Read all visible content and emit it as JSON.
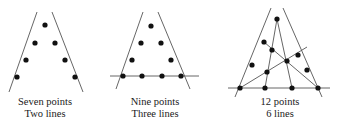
{
  "figures": [
    {
      "caption_line1": "Seven points",
      "caption_line2": "Two lines",
      "lines": [
        [
          37,
          12,
          9,
          92
        ],
        [
          52,
          12,
          83,
          92
        ]
      ],
      "points": [
        [
          45,
          25
        ],
        [
          35,
          43
        ],
        [
          26,
          60
        ],
        [
          17,
          77
        ],
        [
          55,
          43
        ],
        [
          65,
          60
        ],
        [
          75,
          77
        ]
      ]
    },
    {
      "caption_line1": "Nine points",
      "caption_line2": "Three lines",
      "lines": [
        [
          143,
          12,
          116,
          89
        ],
        [
          158,
          12,
          190,
          89
        ],
        [
          110,
          76,
          199,
          76
        ]
      ],
      "points": [
        [
          151,
          26
        ],
        [
          141,
          43
        ],
        [
          132,
          60
        ],
        [
          123,
          76
        ],
        [
          161,
          43
        ],
        [
          171,
          60
        ],
        [
          181,
          76
        ],
        [
          142,
          76
        ],
        [
          162,
          76
        ]
      ]
    },
    {
      "caption_line1": "12 points",
      "caption_line2": "6 lines",
      "lines": [
        [
          271,
          8,
          235,
          97
        ],
        [
          283,
          8,
          322,
          97
        ],
        [
          228,
          88,
          330,
          88
        ],
        [
          277,
          19,
          265,
          88
        ],
        [
          277,
          19,
          292,
          88
        ],
        [
          240,
          88,
          307,
          47
        ],
        [
          264,
          42,
          318,
          88
        ]
      ],
      "points": [
        [
          277,
          19
        ],
        [
          264,
          42
        ],
        [
          252,
          65
        ],
        [
          240,
          88
        ],
        [
          272,
          50
        ],
        [
          287,
          61
        ],
        [
          298,
          55
        ],
        [
          267,
          72
        ],
        [
          307,
          70
        ],
        [
          265,
          88
        ],
        [
          292,
          88
        ],
        [
          318,
          88
        ]
      ]
    }
  ],
  "colors": {
    "line": "#555555",
    "point": "#111111",
    "text": "#1a1a1a"
  }
}
